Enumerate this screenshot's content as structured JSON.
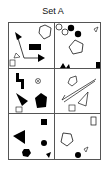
{
  "title": "Set A",
  "colors": {
    "stroke": "#111111",
    "fill_black": "#000000",
    "border": "#555555"
  },
  "grid": {
    "rows": 3,
    "cols": 2
  },
  "cells": [
    {
      "position": "row1-col1",
      "shapes": [
        "arrow-filled-pointing-up-left",
        "arrow-filled-pointing-right",
        "black-rectangle",
        "outline-pentagon",
        "outline-small-triangle",
        "outline-small-square"
      ]
    },
    {
      "position": "row1-col2",
      "shapes": [
        "outline-circle",
        "outline-circle",
        "black-circle",
        "black-circle",
        "outline-pentagon",
        "outline-small-triangle",
        "black-star-shape",
        "black-small-square"
      ]
    },
    {
      "position": "row2-col1",
      "shapes": [
        "black-bracket-shape",
        "circle-with-x",
        "black-triangle",
        "black-pentagon",
        "outline-small-square"
      ]
    },
    {
      "position": "row2-col2",
      "shapes": [
        "outline-pentagon",
        "diagonal-lines",
        "outline-triangle",
        "outline-small-square"
      ]
    },
    {
      "position": "row3-col1",
      "shapes": [
        "black-small-square",
        "black-large-triangle",
        "black-circle",
        "black-hexagon",
        "black-small-triangle"
      ]
    },
    {
      "position": "row3-col2",
      "shapes": [
        "outline-tall-rectangle",
        "outline-pentagon",
        "black-circle",
        "outline-small-triangle"
      ]
    }
  ]
}
